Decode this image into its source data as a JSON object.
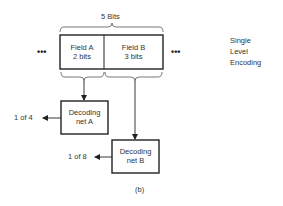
{
  "diagram": {
    "title_brace": "5 Bits",
    "fields": [
      {
        "name": "Field A",
        "width": "2 bits"
      },
      {
        "name": "Field B",
        "width": "3 bits"
      }
    ],
    "ellipsis_left": "•••",
    "ellipsis_right": "•••",
    "side_note": [
      "Single",
      "Level",
      "Encoding"
    ],
    "decoders": [
      {
        "line1": "Decoding",
        "line2": "net A",
        "output": "1 of 4"
      },
      {
        "line1": "Decoding",
        "line2": "net B",
        "output": "1 of 8"
      }
    ],
    "caption": "(b)"
  }
}
